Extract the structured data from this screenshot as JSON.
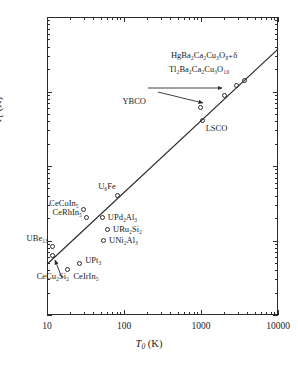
{
  "chart_data": {
    "type": "scatter",
    "title": "",
    "xlabel": "T0 (K)",
    "ylabel": "Tc (K)",
    "xscale": "log",
    "yscale": "log",
    "xlim": [
      10,
      10000
    ],
    "ylim": [
      0.1,
      1000
    ],
    "grid": false,
    "legend": "none",
    "xticks": [
      "10",
      "100",
      "1000",
      "10000"
    ],
    "yticks": [
      "0.1",
      "1",
      "10",
      "100",
      "1000"
    ],
    "trendline": {
      "label": "Tc = T0/20 guide line",
      "x0": 10,
      "y0": 0.48,
      "x1": 10000,
      "y1": 370
    },
    "points": [
      {
        "name": "CeCu2Si2",
        "label": "CeCu₂Si₂",
        "x": 12,
        "y": 0.62
      },
      {
        "name": "UBe13",
        "label": "UBe₁₃",
        "x": 12,
        "y": 0.82
      },
      {
        "name": "CeIrIn5",
        "label": "CeIrIn₅",
        "x": 19,
        "y": 0.4
      },
      {
        "name": "UPt3",
        "label": "UPt₃",
        "x": 27,
        "y": 0.48
      },
      {
        "name": "CeRhIn5",
        "label": "CeRhIn₅",
        "x": 33,
        "y": 2.0
      },
      {
        "name": "CeCoIn5",
        "label": "CeCoIn₅",
        "x": 30,
        "y": 2.6
      },
      {
        "name": "UPd2Al3",
        "label": "UPd₂Al₃",
        "x": 53,
        "y": 2.0
      },
      {
        "name": "URu2Si2",
        "label": "URu₂Si₂",
        "x": 62,
        "y": 1.4
      },
      {
        "name": "UNi2Al3",
        "label": "UNi₂Al₃",
        "x": 55,
        "y": 0.97
      },
      {
        "name": "U6Fe",
        "label": "U₆Fe",
        "x": 83,
        "y": 4.0
      },
      {
        "name": "LSCO",
        "label": "LSCO",
        "x": 1050,
        "y": 40
      },
      {
        "name": "YBCO",
        "label": "YBCO",
        "x": 1000,
        "y": 60
      },
      {
        "name": "YBCO-on-line",
        "label": "",
        "x": 2050,
        "y": 88
      },
      {
        "name": "Tl2Ba2Ca2Cu3O10",
        "label": "Tl₂Ba₂Ca₂Cu₃O₁₀",
        "x": 2950,
        "y": 118
      },
      {
        "name": "HgBa2Ca2Cu3O8d",
        "label": "HgBa₂Ca₂Cu₃O₈₊δ",
        "x": 3750,
        "y": 140
      }
    ],
    "annotations": [
      {
        "name": "ybco-arrow-right",
        "text": "",
        "from": [
          148,
          88
        ],
        "to": [
          222,
          88
        ]
      },
      {
        "name": "ybco-arrow-down",
        "text": "",
        "from": [
          158,
          92
        ],
        "to": [
          203,
          103
        ]
      },
      {
        "name": "cecu2si2-arrow",
        "text": "",
        "from": [
          62,
          278
        ],
        "to": [
          55,
          260
        ]
      }
    ]
  },
  "axes": {
    "x_title_symbol": "T",
    "x_title_sub": "0",
    "x_title_unit": "(K)",
    "y_title_symbol": "T",
    "y_title_sub": "c",
    "y_title_unit": "(K)"
  }
}
